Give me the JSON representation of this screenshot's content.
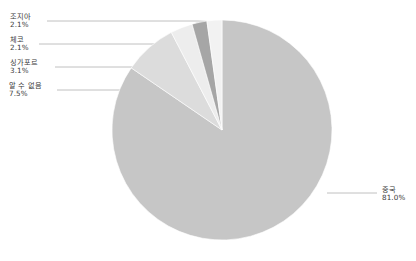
{
  "chart_data": {
    "type": "pie",
    "title": "",
    "subtitle": "",
    "xlabel": "",
    "ylabel": "",
    "legend_position": "none",
    "grid": false,
    "value_unit": "%",
    "categories": [
      "중국",
      "알 수 없음",
      "싱가포르",
      "체코",
      "조지아"
    ],
    "values": [
      81.0,
      7.5,
      3.1,
      2.1,
      2.1
    ],
    "labels": [
      "81.0%",
      "7.5%",
      "3.1%",
      "2.1%",
      "2.1%"
    ],
    "colors": [
      "#c6c6c6",
      "#dcdcdc",
      "#ededed",
      "#a6a6a6",
      "#f2f2f2"
    ],
    "start_angle_deg": 0,
    "direction": "clockwise",
    "annotations": [
      {
        "name": "중국",
        "value": "81.0%",
        "side": "right"
      },
      {
        "name": "알 수 없음",
        "value": "7.5%",
        "side": "left"
      },
      {
        "name": "싱가포르",
        "value": "3.1%",
        "side": "left"
      },
      {
        "name": "체코",
        "value": "2.1%",
        "side": "left"
      },
      {
        "name": "조지아",
        "value": "2.1%",
        "side": "left"
      }
    ]
  },
  "callouts": {
    "georgia": {
      "name": "조지아",
      "value": "2.1%"
    },
    "czech": {
      "name": "체코",
      "value": "2.1%"
    },
    "singapore": {
      "name": "싱가포르",
      "value": "3.1%"
    },
    "unknown": {
      "name": "알 수 없음",
      "value": "7.5%"
    },
    "china": {
      "name": "중국",
      "value": "81.0%"
    }
  }
}
